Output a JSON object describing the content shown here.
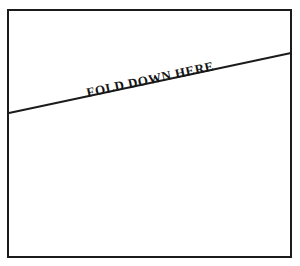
{
  "document": {
    "type": "printed-form-fold-guide",
    "background_color": "#ffffff",
    "ink_color": "#1b1b1b"
  },
  "frame": {
    "name": "form-border",
    "stroke_color": "#1b1b1b",
    "stroke_width": 2,
    "left": 7,
    "top": 9,
    "width": 285,
    "height": 249
  },
  "fold_line": {
    "name": "fold-rule",
    "stroke_color": "#1b1b1b",
    "stroke_width": 2,
    "x1": 9,
    "y1": 113,
    "x2": 291,
    "y2": 53,
    "angle_degrees": -12
  },
  "fold_label": {
    "text": "FOLD DOWN HERE",
    "color": "#141414",
    "font_size": 13,
    "angle_degrees": -12,
    "left": 88,
    "top": 86
  }
}
